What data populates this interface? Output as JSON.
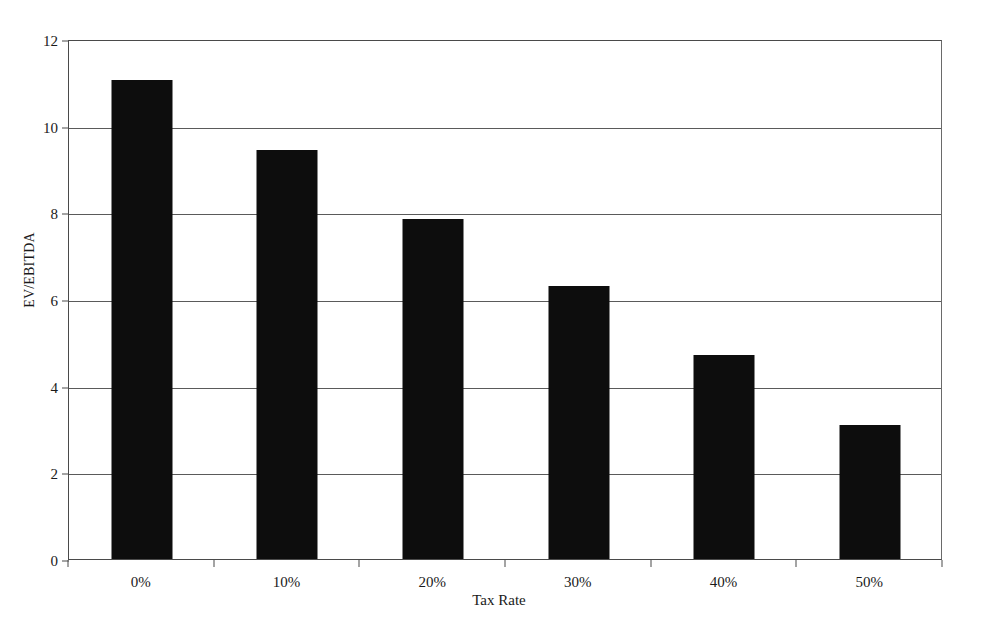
{
  "chart_data": {
    "type": "bar",
    "title": "",
    "categories": [
      "0%",
      "10%",
      "20%",
      "30%",
      "40%",
      "50%"
    ],
    "values": [
      11.05,
      9.45,
      7.85,
      6.3,
      4.7,
      3.1
    ],
    "series": [
      {
        "name": "EV/EBITDA",
        "values": [
          11.05,
          9.45,
          7.85,
          6.3,
          4.7,
          3.1
        ]
      }
    ],
    "xlabel": "Tax Rate",
    "ylabel": "EV/EBITDA",
    "ylim": [
      0,
      12
    ],
    "ytick_labels": [
      "0",
      "2",
      "4",
      "6",
      "8",
      "10",
      "12"
    ],
    "ytick_values": [
      0,
      2,
      4,
      6,
      8,
      10,
      12
    ],
    "grid": true,
    "grid_axis": "y",
    "legend": false,
    "legend_position": "none",
    "bar_color": "#0d0d0d",
    "background_color": "#ffffff",
    "axis_color": "#4a4a4a"
  }
}
